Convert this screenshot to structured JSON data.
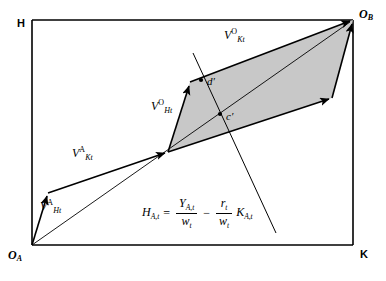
{
  "figure": {
    "width": 386,
    "height": 281,
    "background_color": "#ffffff",
    "line_color": "#000000",
    "shaded_region_fill": "#c8c8c8"
  },
  "axes": {
    "top_left_label": "H",
    "bottom_right_label": "K",
    "origin_a_label": "O",
    "origin_a_sub": "A",
    "origin_b_label": "O",
    "origin_b_sub": "B",
    "box": {
      "left": 32,
      "top": 20,
      "right": 353,
      "bottom": 245
    }
  },
  "vectors": [
    {
      "name": "v-h-a",
      "symbol": "V",
      "superscript": "A",
      "subscript": "Ht",
      "label_x": 40,
      "label_y": 205,
      "from": {
        "x": 32,
        "y": 245
      },
      "to": {
        "x": 48,
        "y": 193
      }
    },
    {
      "name": "v-k-a",
      "symbol": "V",
      "superscript": "A",
      "subscript": "Kt",
      "label_x": 72,
      "label_y": 152,
      "from": {
        "x": 48,
        "y": 193
      },
      "to": {
        "x": 168,
        "y": 152
      }
    },
    {
      "name": "v-h-o",
      "symbol": "V",
      "superscript": "O",
      "subscript": "Ht",
      "label_x": 151,
      "label_y": 105,
      "from": {
        "x": 168,
        "y": 152
      },
      "to": {
        "x": 190,
        "y": 82
      }
    },
    {
      "name": "v-k-o",
      "symbol": "V",
      "superscript": "O",
      "subscript": "Kt",
      "label_x": 224,
      "label_y": 34,
      "from": {
        "x": 190,
        "y": 82
      },
      "to": {
        "x": 353,
        "y": 20
      }
    },
    {
      "name": "v-k-o-lower",
      "from": {
        "x": 168,
        "y": 152
      },
      "to": {
        "x": 332,
        "y": 98
      }
    },
    {
      "name": "v-h-o-right",
      "from": {
        "x": 332,
        "y": 98
      },
      "to": {
        "x": 353,
        "y": 20
      }
    }
  ],
  "points": [
    {
      "name": "point-d-prime",
      "label": "d′",
      "x": 208,
      "y": 82,
      "dot_x": 201,
      "dot_y": 80
    },
    {
      "name": "point-c-prime",
      "label": "c′",
      "x": 227,
      "y": 117,
      "dot_x": 220,
      "dot_y": 114
    }
  ],
  "lines": [
    {
      "name": "diagonal-oa-ob",
      "from": {
        "x": 32,
        "y": 245
      },
      "to": {
        "x": 353,
        "y": 20
      }
    },
    {
      "name": "budget-line-steep",
      "from": {
        "x": 193,
        "y": 53
      },
      "to": {
        "x": 276,
        "y": 233
      }
    }
  ],
  "shaded_polygon": {
    "name": "parallelogram",
    "points": "168,152 190,82 353,20 332,98"
  },
  "equation": {
    "lhs": "H",
    "lhs_sub": "A,t",
    "equals": "=",
    "term1_num": "Y",
    "term1_num_sub": "A,t",
    "term1_den": "w",
    "term1_den_sub": "t",
    "minus": "−",
    "term2_num": "r",
    "term2_num_sub": "t",
    "term2_den": "w",
    "term2_den_sub": "t",
    "term3": "K",
    "term3_sub": "A,t",
    "x": 142,
    "y": 198
  }
}
